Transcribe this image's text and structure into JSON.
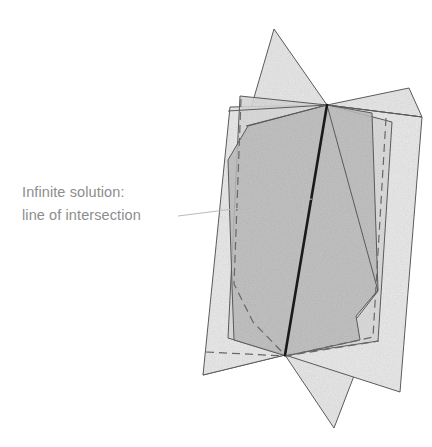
{
  "figure": {
    "annotation": {
      "line1": "Infinite solution:",
      "line2": "line of intersection",
      "color": "#8d8d8d",
      "leader_line": {
        "from_x": 178,
        "from_y": 216,
        "to_x": 312,
        "to_y": 199,
        "color": "#b9b9b9"
      }
    },
    "colors": {
      "background": "#ffffff",
      "plane_light": "#ebebeb",
      "plane_mid": "#d8d8d8",
      "plane_overlap": "#c2c2c2",
      "plane_dark_overlap": "#b3b3b3",
      "edge_stroke": "#5a5a5a",
      "hidden_edge_stroke": "#6b6b6b",
      "intersection_line": "#1a1a1a"
    },
    "intersection_line": {
      "label": "line of intersection",
      "top_x": 327,
      "top_y": 105,
      "bottom_x": 285,
      "bottom_y": 355,
      "width_px": 2.6
    },
    "planes": [
      {
        "name": "plane-back-left",
        "fill": "#ebebeb",
        "points": "230,107 327,105 285,355 203,375",
        "stroke": "#5a5a5a"
      },
      {
        "name": "plane-back-right",
        "fill": "#ebebeb",
        "points": "327,105 422,117 400,392 285,355",
        "stroke": "#5a5a5a"
      },
      {
        "name": "plane-front-left",
        "fill": "#d8d8d8",
        "points": "246,125 327,105 285,355 228,338",
        "stroke": "#5a5a5a"
      },
      {
        "name": "plane-front-right",
        "fill": "#d8d8d8",
        "points": "327,105 392,122 378,340 285,355",
        "stroke": "#5a5a5a"
      },
      {
        "name": "plane-spike-top",
        "fill": "#e4e4e4",
        "points": "274,29 327,105 246,125",
        "stroke": "#5a5a5a"
      },
      {
        "name": "plane-wing-top-right",
        "fill": "#e4e4e4",
        "points": "327,105 409,88 422,117",
        "stroke": "#5a5a5a"
      },
      {
        "name": "plane-wing-bottom-left",
        "fill": "#e4e4e4",
        "points": "285,355 203,375 215,338",
        "stroke": "#5a5a5a"
      },
      {
        "name": "plane-spike-bottom",
        "fill": "#e4e4e4",
        "points": "285,355 334,428 356,370",
        "stroke": "#5a5a5a"
      }
    ],
    "hidden_edges": [
      {
        "name": "hidden-edge-left",
        "points": "240,100 233,286 252,323 287,357",
        "stroke": "#6b6b6b",
        "dash": "8,5"
      },
      {
        "name": "hidden-edge-right",
        "points": "386,118 372,336 286,356",
        "stroke": "#6b6b6b",
        "dash": "8,5"
      },
      {
        "name": "hidden-edge-bottom",
        "points": "205,352 285,356 378,341",
        "stroke": "#6b6b6b",
        "dash": "8,5"
      }
    ]
  }
}
